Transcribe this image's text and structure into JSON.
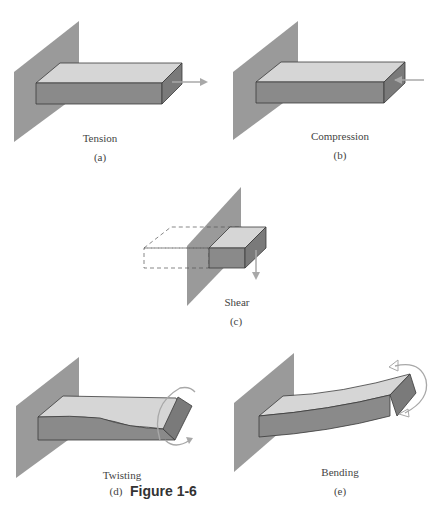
{
  "figure": {
    "label": "Figure 1-6",
    "colors": {
      "wall": "#9a9a9a",
      "top_face": "#d6d6d6",
      "front_face": "#8a8a8a",
      "side_face": "#7a7a7a",
      "arrow": "#a8a8a8",
      "outline": "#3a3a3a"
    },
    "panels": [
      {
        "id": "a",
        "caption": "Tension",
        "sublabel": "(a)"
      },
      {
        "id": "b",
        "caption": "Compression",
        "sublabel": "(b)"
      },
      {
        "id": "c",
        "caption": "Shear",
        "sublabel": "(c)"
      },
      {
        "id": "d",
        "caption": "Twisting",
        "sublabel": "(d)"
      },
      {
        "id": "e",
        "caption": "Bending",
        "sublabel": "(e)"
      }
    ]
  }
}
